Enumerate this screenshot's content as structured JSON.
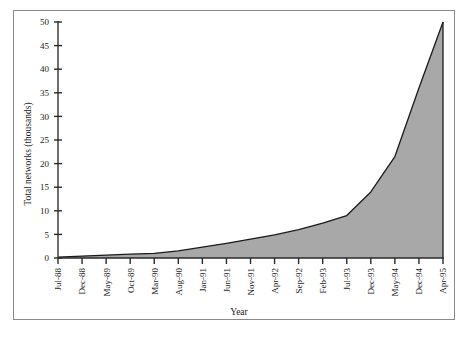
{
  "chart_data": {
    "type": "area",
    "title": "",
    "xlabel": "Year",
    "ylabel": "Total networks (thousands)",
    "ylim": [
      0,
      50
    ],
    "ytick_labels": [
      "0",
      "5",
      "10",
      "15",
      "20",
      "25",
      "30",
      "35",
      "40",
      "45",
      "50"
    ],
    "ytick_values": [
      0,
      5,
      10,
      15,
      20,
      25,
      30,
      35,
      40,
      45,
      50
    ],
    "grid": false,
    "legend": "none",
    "fill_color": "#a8a8a8",
    "line_color": "#1a1a1a",
    "categories": [
      "Jul-88",
      "Dec-88",
      "May-89",
      "Oct-89",
      "Mar-90",
      "Aug-90",
      "Jan-91",
      "Jun-91",
      "Nov-91",
      "Apr-92",
      "Sep-92",
      "Feb-93",
      "Jul-93",
      "Dec-93",
      "May-94",
      "Dec-94",
      "Apr-95"
    ],
    "values": [
      0.2,
      0.4,
      0.6,
      0.8,
      1.0,
      1.5,
      2.3,
      3.1,
      4.0,
      4.9,
      6.0,
      7.4,
      9.0,
      14.0,
      21.5,
      36.0,
      50.0
    ],
    "x_positions": [
      0.0,
      0.0625,
      0.125,
      0.1875,
      0.25,
      0.3125,
      0.375,
      0.4375,
      0.5,
      0.5625,
      0.625,
      0.6875,
      0.75,
      0.8125,
      0.875,
      0.9375,
      1.0
    ]
  }
}
